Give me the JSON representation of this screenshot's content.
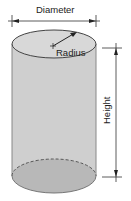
{
  "diagram": {
    "labels": {
      "diameter": "Diameter",
      "radius": "Radius",
      "height": "Height"
    },
    "colors": {
      "body_fill": "#cfcfcf",
      "top_fill": "#d8d8d8",
      "bottom_fill": "#b8b8b8",
      "stroke": "#444444",
      "background": "#ffffff"
    }
  }
}
